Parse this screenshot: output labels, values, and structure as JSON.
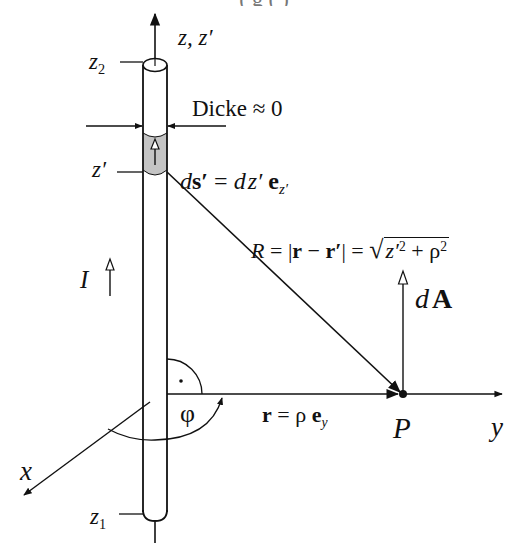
{
  "figure": {
    "title_fragment": "(         g        (              )",
    "axes": {
      "z_label": "z, z′",
      "x_label": "x",
      "y_label": "y"
    },
    "conductor": {
      "top_label_var": "z",
      "top_label_sub": "2",
      "bottom_label_var": "z",
      "bottom_label_sub": "1",
      "element_label": "z′",
      "thickness_label": "Dicke ≈ 0",
      "current_label": "I"
    },
    "element": {
      "ds_lhs_d": "d",
      "ds_lhs_s": "s′",
      "ds_eq": " = ",
      "ds_rhs_d": "d",
      "ds_rhs_z": "z′",
      "ds_rhs_e": "e",
      "ds_rhs_sub": "z′"
    },
    "distance": {
      "R": "R",
      "eq1": " = ",
      "bar_open": "|",
      "r": "r",
      "minus": " − ",
      "r_prime": "r′",
      "bar_close": "|",
      "eq2": " = ",
      "sqrt": "√",
      "z_prime": "z′",
      "sq1": "2",
      "plus": " + ",
      "rho": "ρ",
      "sq2": "2"
    },
    "point": {
      "label": "P",
      "dA_d": "d",
      "dA_A": "A",
      "r_vec": "r",
      "r_eq": " = ρ ",
      "r_e": "e",
      "r_sub": "y"
    },
    "angle": {
      "phi": "φ",
      "right_angle_dot": "·"
    },
    "colors": {
      "line": "#111111",
      "segment_fill": "#c8c8c8",
      "background": "#ffffff"
    }
  }
}
